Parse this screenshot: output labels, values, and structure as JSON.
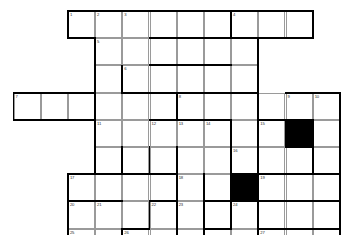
{
  "puzzle": {
    "title": "Crossword Grid",
    "type": "crossword-grid",
    "cols": 12,
    "rows": 11,
    "cell_size": 27.2,
    "origin_x": 13.5,
    "origin_y": 11.0,
    "colors": {
      "background": "#ffffff",
      "cell_fill": "#ffffff",
      "cell_border": "#9a9a9a",
      "block_fill": "#000000",
      "heavy_border": "#000000",
      "number_text": "#2b2b2b"
    },
    "cells": [
      {
        "r": 0,
        "c": 2,
        "n": "1"
      },
      {
        "r": 0,
        "c": 3,
        "n": "2"
      },
      {
        "r": 0,
        "c": 4,
        "n": "3"
      },
      {
        "r": 0,
        "c": 5,
        "n": ""
      },
      {
        "r": 0,
        "c": 6,
        "n": ""
      },
      {
        "r": 0,
        "c": 7,
        "n": ""
      },
      {
        "r": 0,
        "c": 8,
        "n": "4"
      },
      {
        "r": 0,
        "c": 9,
        "n": ""
      },
      {
        "r": 0,
        "c": 10,
        "n": ""
      },
      {
        "r": 1,
        "c": 3,
        "n": "5"
      },
      {
        "r": 1,
        "c": 4,
        "n": ""
      },
      {
        "r": 1,
        "c": 5,
        "n": ""
      },
      {
        "r": 1,
        "c": 6,
        "n": ""
      },
      {
        "r": 1,
        "c": 7,
        "n": ""
      },
      {
        "r": 1,
        "c": 8,
        "n": ""
      },
      {
        "r": 2,
        "c": 3,
        "n": ""
      },
      {
        "r": 2,
        "c": 4,
        "n": "6"
      },
      {
        "r": 2,
        "c": 5,
        "n": ""
      },
      {
        "r": 2,
        "c": 6,
        "n": ""
      },
      {
        "r": 2,
        "c": 7,
        "n": ""
      },
      {
        "r": 2,
        "c": 8,
        "n": ""
      },
      {
        "r": 3,
        "c": 0,
        "n": "7"
      },
      {
        "r": 3,
        "c": 1,
        "n": ""
      },
      {
        "r": 3,
        "c": 2,
        "n": ""
      },
      {
        "r": 3,
        "c": 3,
        "n": ""
      },
      {
        "r": 3,
        "c": 4,
        "n": ""
      },
      {
        "r": 3,
        "c": 5,
        "n": ""
      },
      {
        "r": 3,
        "c": 6,
        "n": "8"
      },
      {
        "r": 3,
        "c": 7,
        "n": ""
      },
      {
        "r": 3,
        "c": 8,
        "n": ""
      },
      {
        "r": 3,
        "c": 9,
        "n": ""
      },
      {
        "r": 3,
        "c": 10,
        "n": "9"
      },
      {
        "r": 3,
        "c": 11,
        "n": "10"
      },
      {
        "r": 4,
        "c": 3,
        "n": "11"
      },
      {
        "r": 4,
        "c": 4,
        "n": ""
      },
      {
        "r": 4,
        "c": 5,
        "n": "12"
      },
      {
        "r": 4,
        "c": 6,
        "n": "13"
      },
      {
        "r": 4,
        "c": 7,
        "n": "14"
      },
      {
        "r": 4,
        "c": 8,
        "n": ""
      },
      {
        "r": 4,
        "c": 9,
        "n": "15"
      },
      {
        "r": 4,
        "c": 10,
        "n": "",
        "block": true
      },
      {
        "r": 4,
        "c": 11,
        "n": ""
      },
      {
        "r": 5,
        "c": 3,
        "n": ""
      },
      {
        "r": 5,
        "c": 4,
        "n": ""
      },
      {
        "r": 5,
        "c": 5,
        "n": ""
      },
      {
        "r": 5,
        "c": 6,
        "n": ""
      },
      {
        "r": 5,
        "c": 7,
        "n": ""
      },
      {
        "r": 5,
        "c": 8,
        "n": "16"
      },
      {
        "r": 5,
        "c": 9,
        "n": ""
      },
      {
        "r": 5,
        "c": 10,
        "n": ""
      },
      {
        "r": 5,
        "c": 11,
        "n": ""
      },
      {
        "r": 6,
        "c": 2,
        "n": "17"
      },
      {
        "r": 6,
        "c": 3,
        "n": ""
      },
      {
        "r": 6,
        "c": 4,
        "n": ""
      },
      {
        "r": 6,
        "c": 5,
        "n": ""
      },
      {
        "r": 6,
        "c": 6,
        "n": "18"
      },
      {
        "r": 6,
        "c": 7,
        "n": ""
      },
      {
        "r": 6,
        "c": 8,
        "n": "",
        "block": true
      },
      {
        "r": 6,
        "c": 9,
        "n": "19"
      },
      {
        "r": 6,
        "c": 10,
        "n": ""
      },
      {
        "r": 6,
        "c": 11,
        "n": ""
      },
      {
        "r": 7,
        "c": 2,
        "n": "20"
      },
      {
        "r": 7,
        "c": 3,
        "n": "21"
      },
      {
        "r": 7,
        "c": 4,
        "n": ""
      },
      {
        "r": 7,
        "c": 5,
        "n": "22"
      },
      {
        "r": 7,
        "c": 6,
        "n": "23"
      },
      {
        "r": 7,
        "c": 7,
        "n": ""
      },
      {
        "r": 7,
        "c": 8,
        "n": "24"
      },
      {
        "r": 7,
        "c": 9,
        "n": ""
      },
      {
        "r": 7,
        "c": 10,
        "n": ""
      },
      {
        "r": 7,
        "c": 11,
        "n": ""
      },
      {
        "r": 8,
        "c": 2,
        "n": "25"
      },
      {
        "r": 8,
        "c": 3,
        "n": ""
      },
      {
        "r": 8,
        "c": 4,
        "n": "26"
      },
      {
        "r": 8,
        "c": 5,
        "n": ""
      },
      {
        "r": 8,
        "c": 6,
        "n": ""
      },
      {
        "r": 8,
        "c": 7,
        "n": ""
      },
      {
        "r": 8,
        "c": 8,
        "n": ""
      },
      {
        "r": 8,
        "c": 9,
        "n": "27"
      },
      {
        "r": 8,
        "c": 10,
        "n": ""
      },
      {
        "r": 8,
        "c": 11,
        "n": ""
      },
      {
        "r": 9,
        "c": 1,
        "n": "28"
      },
      {
        "r": 9,
        "c": 2,
        "n": ""
      },
      {
        "r": 9,
        "c": 3,
        "n": ""
      },
      {
        "r": 9,
        "c": 4,
        "n": ""
      },
      {
        "r": 9,
        "c": 5,
        "n": ""
      },
      {
        "r": 9,
        "c": 6,
        "n": ""
      },
      {
        "r": 9,
        "c": 7,
        "n": ""
      },
      {
        "r": 9,
        "c": 8,
        "n": ""
      },
      {
        "r": 9,
        "c": 9,
        "n": ""
      },
      {
        "r": 9,
        "c": 10,
        "n": ""
      },
      {
        "r": 10,
        "c": 4,
        "n": "29"
      },
      {
        "r": 10,
        "c": 5,
        "n": ""
      },
      {
        "r": 10,
        "c": 6,
        "n": ""
      },
      {
        "r": 10,
        "c": 7,
        "n": ""
      },
      {
        "r": 10,
        "c": 8,
        "n": "30"
      },
      {
        "r": 10,
        "c": 9,
        "n": ""
      },
      {
        "r": 10,
        "c": 10,
        "n": ""
      }
    ],
    "heavy_horizontal": [
      {
        "r": 0,
        "c": 2,
        "len": 6
      },
      {
        "r": 0,
        "c": 8,
        "len": 3
      },
      {
        "r": 1,
        "c": 2,
        "len": 1
      },
      {
        "r": 1,
        "c": 5,
        "len": 3
      },
      {
        "r": 1,
        "c": 8,
        "len": 3
      },
      {
        "r": 2,
        "c": 5,
        "len": 3
      },
      {
        "r": 3,
        "c": 0,
        "len": 3
      },
      {
        "r": 3,
        "c": 4,
        "len": 2
      },
      {
        "r": 3,
        "c": 6,
        "len": 3
      },
      {
        "r": 3,
        "c": 10,
        "len": 2
      },
      {
        "r": 4,
        "c": 0,
        "len": 3
      },
      {
        "r": 4,
        "c": 5,
        "len": 3
      },
      {
        "r": 4,
        "c": 9,
        "len": 1
      },
      {
        "r": 4,
        "c": 10,
        "len": 1
      },
      {
        "r": 5,
        "c": 10,
        "len": 1
      },
      {
        "r": 6,
        "c": 2,
        "len": 1
      },
      {
        "r": 6,
        "c": 3,
        "len": 3
      },
      {
        "r": 6,
        "c": 8,
        "len": 1
      },
      {
        "r": 6,
        "c": 9,
        "len": 1
      },
      {
        "r": 6,
        "c": 10,
        "len": 2
      },
      {
        "r": 7,
        "c": 2,
        "len": 2
      },
      {
        "r": 7,
        "c": 5,
        "len": 1
      },
      {
        "r": 7,
        "c": 7,
        "len": 1
      },
      {
        "r": 7,
        "c": 8,
        "len": 1
      },
      {
        "r": 7,
        "c": 9,
        "len": 1
      },
      {
        "r": 7,
        "c": 10,
        "len": 2
      },
      {
        "r": 8,
        "c": 4,
        "len": 1
      },
      {
        "r": 8,
        "c": 7,
        "len": 1
      },
      {
        "r": 8,
        "c": 9,
        "len": 3
      },
      {
        "r": 9,
        "c": 1,
        "len": 1
      },
      {
        "r": 9,
        "c": 2,
        "len": 2
      },
      {
        "r": 9,
        "c": 5,
        "len": 3
      },
      {
        "r": 9,
        "c": 9,
        "len": 2
      },
      {
        "r": 10,
        "c": 1,
        "len": 3
      },
      {
        "r": 10,
        "c": 5,
        "len": 3
      },
      {
        "r": 10,
        "c": 8,
        "len": 3
      },
      {
        "r": 11,
        "c": 4,
        "len": 7
      }
    ],
    "heavy_vertical": [
      {
        "r": 0,
        "c": 2,
        "len": 1
      },
      {
        "r": 0,
        "c": 8,
        "len": 1
      },
      {
        "r": 0,
        "c": 11,
        "len": 1
      },
      {
        "r": 1,
        "c": 3,
        "len": 3
      },
      {
        "r": 1,
        "c": 9,
        "len": 3
      },
      {
        "r": 2,
        "c": 4,
        "len": 1
      },
      {
        "r": 3,
        "c": 0,
        "len": 1
      },
      {
        "r": 3,
        "c": 6,
        "len": 1
      },
      {
        "r": 3,
        "c": 12,
        "len": 6
      },
      {
        "r": 4,
        "c": 3,
        "len": 2
      },
      {
        "r": 4,
        "c": 8,
        "len": 1
      },
      {
        "r": 4,
        "c": 9,
        "len": 1
      },
      {
        "r": 4,
        "c": 10,
        "len": 1
      },
      {
        "r": 4,
        "c": 11,
        "len": 2
      },
      {
        "r": 5,
        "c": 4,
        "len": 1
      },
      {
        "r": 5,
        "c": 5,
        "len": 1
      },
      {
        "r": 5,
        "c": 6,
        "len": 1
      },
      {
        "r": 5,
        "c": 8,
        "len": 3
      },
      {
        "r": 5,
        "c": 9,
        "len": 2
      },
      {
        "r": 6,
        "c": 2,
        "len": 4
      },
      {
        "r": 6,
        "c": 6,
        "len": 1
      },
      {
        "r": 6,
        "c": 7,
        "len": 2
      },
      {
        "r": 7,
        "c": 5,
        "len": 1
      },
      {
        "r": 7,
        "c": 6,
        "len": 2
      },
      {
        "r": 7,
        "c": 9,
        "len": 1
      },
      {
        "r": 8,
        "c": 4,
        "len": 1
      },
      {
        "r": 8,
        "c": 7,
        "len": 1
      },
      {
        "r": 8,
        "c": 9,
        "len": 1
      },
      {
        "r": 9,
        "c": 1,
        "len": 1
      },
      {
        "r": 9,
        "c": 4,
        "len": 2
      },
      {
        "r": 9,
        "c": 11,
        "len": 1
      },
      {
        "r": 9,
        "c": 10,
        "len": 2
      },
      {
        "r": 10,
        "c": 4,
        "len": 1
      },
      {
        "r": 10,
        "c": 8,
        "len": 1
      },
      {
        "r": 10,
        "c": 11,
        "len": 1
      }
    ]
  }
}
